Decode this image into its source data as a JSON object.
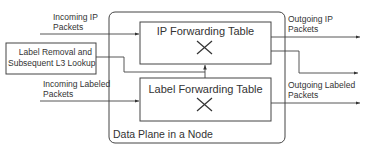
{
  "diagram": {
    "container_label": "Data Plane in a Node",
    "ip_table": {
      "title": "IP Forwarding Table",
      "symbol": "x-cross-icon"
    },
    "label_table": {
      "title": "Label Forwarding Table",
      "symbol": "x-cross-icon"
    },
    "label_removal_box": {
      "line1": "Label Removal and",
      "line2": "Subsequent L3 Lookup"
    },
    "inputs": {
      "incoming_ip": {
        "line1": "Incoming IP",
        "line2": "Packets"
      },
      "incoming_labeled": {
        "line1": "Incoming Labeled",
        "line2": "Packets"
      }
    },
    "outputs": {
      "outgoing_ip": {
        "line1": "Outgoing IP",
        "line2": "Packets"
      },
      "outgoing_labeled": {
        "line1": "Outgoing Labeled",
        "line2": "Packets"
      }
    },
    "colors": {
      "line": "#444444",
      "background": "#ffffff"
    }
  }
}
